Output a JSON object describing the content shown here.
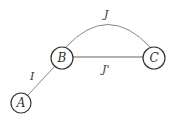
{
  "diagram": {
    "nodes": [
      {
        "id": "A",
        "label": "A",
        "x": 21,
        "y": 103,
        "r": 10
      },
      {
        "id": "B",
        "label": "B",
        "x": 62,
        "y": 58,
        "r": 11
      },
      {
        "id": "C",
        "label": "C",
        "x": 154,
        "y": 58,
        "r": 11
      }
    ],
    "edges": [
      {
        "from": "A",
        "to": "B",
        "label": "I",
        "shape": "straight"
      },
      {
        "from": "B",
        "to": "C",
        "label": "J",
        "shape": "arc"
      },
      {
        "from": "B",
        "to": "C",
        "label": "J'",
        "shape": "straight"
      }
    ],
    "colors": {
      "stroke": "#333333",
      "edge": "#888888",
      "background": "#ffffff"
    }
  }
}
